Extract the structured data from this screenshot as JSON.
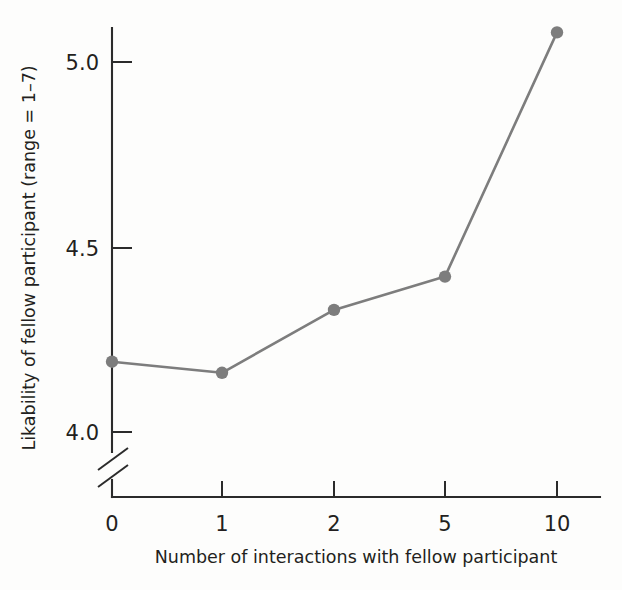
{
  "chart_data": {
    "type": "line",
    "title": "",
    "xlabel": "Number of interactions with fellow participant",
    "ylabel": "Likability of fellow participant (range = 1–7)",
    "categories": [
      "0",
      "1",
      "2",
      "5",
      "10"
    ],
    "x": [
      0,
      1,
      2,
      5,
      10
    ],
    "values": [
      4.19,
      4.16,
      4.33,
      4.42,
      5.08
    ],
    "series": [
      {
        "name": "Likability",
        "values": [
          4.19,
          4.16,
          4.33,
          4.42,
          5.08
        ]
      }
    ],
    "y_ticks": [
      "4.0",
      "4.5",
      "5.0"
    ],
    "y_tick_values": [
      4.0,
      4.5,
      5.0
    ],
    "x_tick_labels": [
      "0",
      "1",
      "2",
      "5",
      "10"
    ],
    "ylim": [
      3.9,
      5.15
    ],
    "axis_break": true,
    "axis_break_note": "y-axis broken below 4.0",
    "grid": false,
    "legend": "none",
    "series_color": "#7d7d7d",
    "axis_color": "#2b2b2b",
    "background_color": "#fdfdfc"
  },
  "labels": {
    "y_axis_title": "Likability of fellow participant (range = 1–7)",
    "x_axis_title": "Number of interactions with fellow participant",
    "y_tick_5_0": "5.0",
    "y_tick_4_5": "4.5",
    "y_tick_4_0": "4.0",
    "x_tick_0": "0",
    "x_tick_1": "1",
    "x_tick_2": "2",
    "x_tick_5": "5",
    "x_tick_10": "10"
  }
}
